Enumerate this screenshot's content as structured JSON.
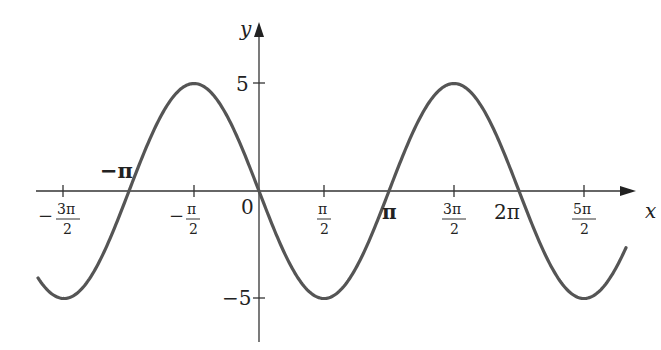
{
  "chart_data": {
    "type": "line",
    "title": "",
    "function": "y = -5 sin(x)",
    "xlabel": "x",
    "ylabel": "y",
    "x_range": [
      -5.5,
      7.85
    ],
    "ylim": [
      -7.5,
      8.5
    ],
    "grid": false,
    "legend": null,
    "curve_color": "#555555",
    "x_ticks": [
      {
        "value": -4.712389,
        "label": "-3π/2"
      },
      {
        "value": -3.141593,
        "label": "-π"
      },
      {
        "value": -1.570796,
        "label": "-π/2"
      },
      {
        "value": 0,
        "label": "0"
      },
      {
        "value": 1.570796,
        "label": "π/2"
      },
      {
        "value": 3.141593,
        "label": "π"
      },
      {
        "value": 4.712389,
        "label": "3π/2"
      },
      {
        "value": 6.283185,
        "label": "2π"
      },
      {
        "value": 7.853982,
        "label": "5π/2"
      }
    ],
    "y_ticks": [
      {
        "value": 5,
        "label": "5"
      },
      {
        "value": -5,
        "label": "-5"
      }
    ],
    "key_points": [
      {
        "x": -4.712389,
        "y": -5
      },
      {
        "x": -3.141593,
        "y": 0
      },
      {
        "x": -1.570796,
        "y": 5
      },
      {
        "x": 0,
        "y": 0
      },
      {
        "x": 1.570796,
        "y": -5
      },
      {
        "x": 3.141593,
        "y": 0
      },
      {
        "x": 4.712389,
        "y": 5
      },
      {
        "x": 6.283185,
        "y": 0
      },
      {
        "x": 7.853982,
        "y": -5
      }
    ]
  },
  "labels": {
    "x_axis": "x",
    "y_axis": "y",
    "origin": "0",
    "y_pos5": "5",
    "y_neg5": "−5",
    "neg_pi": "−π",
    "pi": "π",
    "two_pi": "2π",
    "neg_3pi_2_num": "3π",
    "neg_pi_2_num": "π",
    "pi_2_num": "π",
    "three_pi_2_num": "3π",
    "five_pi_2_num": "5π",
    "den": "2",
    "minus": "−"
  }
}
